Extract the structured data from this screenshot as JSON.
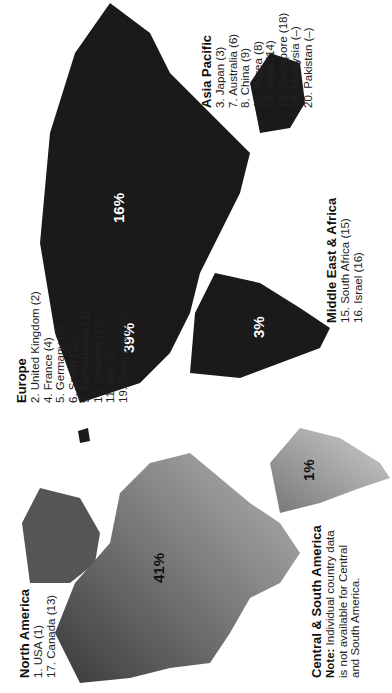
{
  "regions": {
    "north_america": {
      "title": "North America",
      "share": "41%",
      "countries": [
        "1.   USA (1)",
        "17. Canada (13)"
      ]
    },
    "europe": {
      "title": "Europe",
      "share": "39%",
      "countries": [
        "2.   United Kingdom (2)",
        "4.   France (4)",
        "5.   Germany (7)",
        "6.   Spain (10)",
        "9.   Netherlands (11)",
        "10. Sweden (12)",
        "11. Italy (5)",
        "19. Denmark (20)"
      ]
    },
    "asia_pacific": {
      "title": "Asia Pacific",
      "share": "16%",
      "countries": [
        "3.   Japan (3)",
        "7.   Australia (6)",
        "8.   China (9)",
        "12. Korea (8)",
        "13. India (14)",
        "14. Singapore (18)",
        "18. Malaysia (–)",
        "20. Pakistan (–)"
      ]
    },
    "middle_east_africa": {
      "title": "Middle East & Africa",
      "share": "3%",
      "countries": [
        "15. South Africa (15)",
        "16. Israel (16)"
      ]
    },
    "central_south_america": {
      "title": "Central & South America",
      "share": "1%",
      "note_label": "Note:",
      "note_text": " Individual country data is not available for Central and South America."
    }
  },
  "colors": {
    "old_world": "#1a1a1a",
    "americas_dark": "#555555",
    "americas_light": "#a8a8a8"
  }
}
